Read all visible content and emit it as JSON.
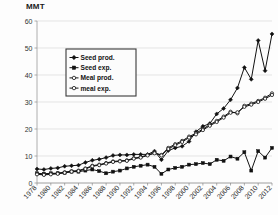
{
  "chart_data": {
    "type": "line",
    "title": "",
    "subtitle": "",
    "xlabel": "",
    "ylabel": "MMT",
    "ylim": [
      0,
      60
    ],
    "ytick_labels": [
      "0",
      "10",
      "20",
      "30",
      "40",
      "50",
      "60"
    ],
    "yticks": [
      0,
      10,
      20,
      30,
      40,
      50,
      60
    ],
    "grid": true,
    "legend_position": "upper-left-inside",
    "x": [
      1978,
      1979,
      1980,
      1981,
      1982,
      1983,
      1984,
      1985,
      1986,
      1987,
      1988,
      1989,
      1990,
      1991,
      1992,
      1993,
      1994,
      1995,
      1996,
      1997,
      1998,
      1999,
      2000,
      2001,
      2002,
      2003,
      2004,
      2005,
      2006,
      2007,
      2008,
      2009,
      2010,
      2011,
      2012
    ],
    "xtick_labels": [
      "1978",
      "1980",
      "1982",
      "1984",
      "1986",
      "1988",
      "1990",
      "1992",
      "1994",
      "1996",
      "1998",
      "2000",
      "2002",
      "2004",
      "2006",
      "2008",
      "2010",
      "2012"
    ],
    "xticks": [
      1978,
      1980,
      1982,
      1984,
      1986,
      1988,
      1990,
      1992,
      1994,
      1996,
      1998,
      2000,
      2002,
      2004,
      2006,
      2008,
      2010,
      2012
    ],
    "series": [
      {
        "name": "Seed prod.",
        "marker": "filled-diamond",
        "values": [
          5.2,
          5.0,
          5.4,
          5.6,
          6.2,
          6.4,
          6.6,
          7.6,
          8.4,
          8.8,
          9.4,
          10.2,
          10.4,
          10.4,
          10.6,
          10.6,
          10.6,
          11.8,
          8.6,
          12.0,
          13.0,
          13.6,
          15.4,
          19.0,
          21.0,
          22.0,
          25.6,
          27.6,
          30.8,
          35.2,
          42.8,
          38.4,
          52.8,
          41.6,
          55.2
        ]
      },
      {
        "name": "Seed exp.",
        "marker": "filled-square",
        "values": [
          3.6,
          3.4,
          3.6,
          3.6,
          3.8,
          4.2,
          4.2,
          4.6,
          5.0,
          4.4,
          3.6,
          4.2,
          4.6,
          5.4,
          6.0,
          6.4,
          6.8,
          6.0,
          3.4,
          5.0,
          5.6,
          6.0,
          6.8,
          7.0,
          7.4,
          7.0,
          8.6,
          8.2,
          9.8,
          9.0,
          11.4,
          4.6,
          11.8,
          9.4,
          13.0
        ]
      },
      {
        "name": "Meal prod.",
        "marker": "open-circle",
        "values": [
          3.4,
          3.2,
          3.4,
          3.6,
          4.0,
          4.4,
          4.6,
          5.4,
          6.4,
          6.8,
          7.4,
          8.0,
          8.2,
          8.4,
          9.2,
          9.6,
          10.4,
          11.2,
          10.4,
          13.0,
          14.4,
          15.6,
          17.2,
          18.4,
          20.0,
          21.6,
          23.0,
          24.6,
          26.4,
          25.8,
          28.6,
          29.4,
          30.4,
          31.6,
          33.2
        ]
      },
      {
        "name": "meal exp.",
        "marker": "open-circle",
        "values": [
          3.2,
          3.0,
          3.2,
          3.4,
          3.8,
          4.2,
          4.4,
          5.2,
          6.2,
          6.6,
          7.2,
          7.8,
          8.0,
          8.2,
          9.0,
          9.4,
          10.2,
          11.0,
          10.2,
          12.6,
          14.0,
          15.2,
          16.8,
          18.0,
          19.6,
          21.2,
          22.6,
          24.2,
          26.0,
          26.2,
          28.2,
          29.0,
          30.0,
          31.2,
          32.6
        ]
      }
    ],
    "legend": [
      "Seed prod.",
      "Seed exp.",
      "Meal prod.",
      "meal exp."
    ]
  }
}
